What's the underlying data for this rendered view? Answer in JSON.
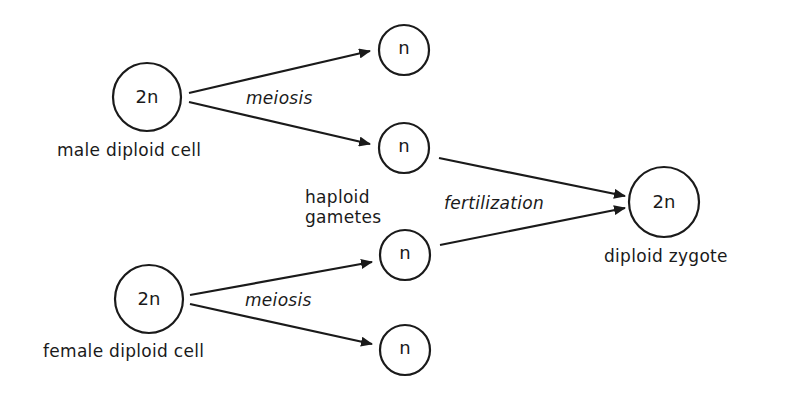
{
  "diagram": {
    "title": "",
    "nodes": {
      "male_diploid": {
        "label": "2n",
        "caption": "male diploid cell"
      },
      "female_diploid": {
        "label": "2n",
        "caption": "female diploid cell"
      },
      "male_gamete_1": {
        "label": "n"
      },
      "male_gamete_2": {
        "label": "n"
      },
      "female_gamete_1": {
        "label": "n"
      },
      "female_gamete_2": {
        "label": "n"
      },
      "zygote": {
        "label": "2n",
        "caption": "diploid  zygote"
      }
    },
    "labels": {
      "meiosis_male": "meiosis",
      "meiosis_female": "meiosis",
      "fertilization": "fertilization",
      "haploid_line1": "haploid",
      "haploid_line2": "gametes"
    },
    "edges": [
      {
        "from": "male_diploid",
        "to": "male_gamete_1",
        "label": "meiosis"
      },
      {
        "from": "male_diploid",
        "to": "male_gamete_2",
        "label": "meiosis"
      },
      {
        "from": "female_diploid",
        "to": "female_gamete_1",
        "label": "meiosis"
      },
      {
        "from": "female_diploid",
        "to": "female_gamete_2",
        "label": "meiosis"
      },
      {
        "from": "male_gamete_2",
        "to": "zygote",
        "label": "fertilization"
      },
      {
        "from": "female_gamete_1",
        "to": "zygote",
        "label": "fertilization"
      }
    ],
    "colors": {
      "stroke": "#1a1a1a",
      "background": "#ffffff"
    }
  }
}
